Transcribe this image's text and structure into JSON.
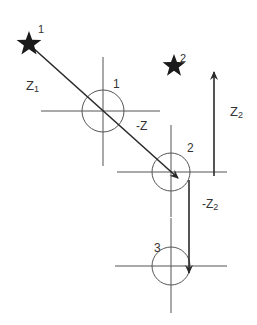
{
  "diagram": {
    "stars": [
      {
        "label": "1",
        "x": 30,
        "y": 45
      },
      {
        "label": "2",
        "x": 176,
        "y": 64
      }
    ],
    "stations": [
      {
        "label": "1",
        "cx": 103,
        "cy": 111,
        "r": 21
      },
      {
        "label": "2",
        "cx": 171,
        "cy": 172,
        "r": 19
      },
      {
        "label": "3",
        "cx": 171,
        "cy": 266,
        "r": 19
      }
    ],
    "vectors": {
      "z1": {
        "label": "Z",
        "sub": "1"
      },
      "neg_z": {
        "label": "-Z"
      },
      "z2": {
        "label": "Z",
        "sub": "2"
      },
      "neg_z2": {
        "label": "-Z",
        "sub": "2"
      }
    },
    "colors": {
      "line": "#2a2a2a",
      "thin": "#555555",
      "star": "#1a1a1a"
    }
  }
}
